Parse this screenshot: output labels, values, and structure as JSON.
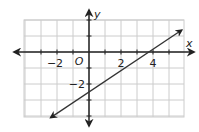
{
  "chart_data": {
    "type": "line",
    "title": "",
    "xlabel": "x",
    "ylabel": "y",
    "origin_label": "O",
    "xlim": [
      -4.5,
      6
    ],
    "ylim": [
      -4.5,
      2
    ],
    "grid": true,
    "x_tick_labels": [
      "−2",
      "2",
      "4"
    ],
    "x_tick_values": [
      -2,
      2,
      4
    ],
    "y_tick_labels": [
      "−2"
    ],
    "y_tick_values": [
      -2
    ],
    "series": [
      {
        "name": "line",
        "equation": "y = (2/3)x - 2.5",
        "slope": 0.667,
        "y_intercept": -2.5,
        "x_intercept": 3.75,
        "points": [
          [
            -2.4,
            -4.1
          ],
          [
            5.8,
            1.37
          ]
        ],
        "arrows_both_ends": true
      }
    ],
    "colors": {
      "grid": "#cccccc",
      "axes": "#222222",
      "line": "#333333"
    }
  }
}
